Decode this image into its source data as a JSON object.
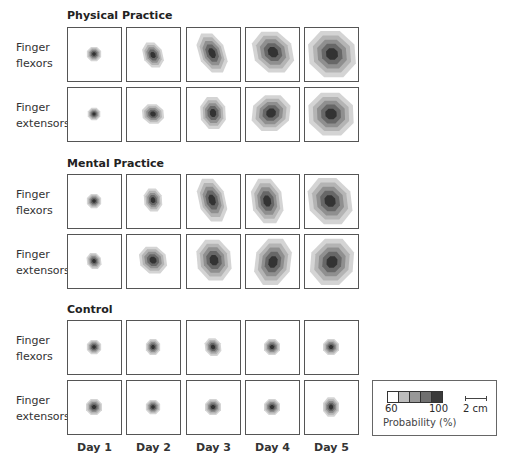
{
  "sections": [
    {
      "title": "Physical Practice",
      "title_top": 9,
      "rows_top": [
        27,
        87
      ]
    },
    {
      "title": "Mental Practice",
      "title_top": 157,
      "rows_top": [
        174,
        234
      ]
    },
    {
      "title": "Control",
      "title_top": 303,
      "rows_top": [
        320,
        380
      ]
    }
  ],
  "row_labels": {
    "flexors": [
      "Finger",
      "flexors"
    ],
    "extensors": [
      "Finger",
      "extensors"
    ]
  },
  "columns_left": [
    67,
    126,
    186,
    245,
    304
  ],
  "days": [
    "Day 1",
    "Day 2",
    "Day 3",
    "Day 4",
    "Day 5"
  ],
  "level_colors": [
    "#d4d4d4",
    "#b4b4b4",
    "#8f8f8f",
    "#676767",
    "#333333"
  ],
  "legend": {
    "swatch_colors": [
      "#ffffff",
      "#bdbdbd",
      "#989898",
      "#707070",
      "#3a3a3a"
    ],
    "min_label": "60",
    "max_label": "100",
    "title": "Probability (%)",
    "scale_label": "2 cm"
  },
  "maps": {
    "physical_flexors": [
      {
        "cx": 27,
        "cy": 27,
        "w": 16,
        "h": 16,
        "sk": 0
      },
      {
        "cx": 27,
        "cy": 28,
        "w": 22,
        "h": 28,
        "sk": 3
      },
      {
        "cx": 26,
        "cy": 26,
        "w": 30,
        "h": 44,
        "sk": 6
      },
      {
        "cx": 28,
        "cy": 25,
        "w": 44,
        "h": 46,
        "sk": 4
      },
      {
        "cx": 28,
        "cy": 27,
        "w": 52,
        "h": 52,
        "sk": 2
      }
    ],
    "physical_extensors": [
      {
        "cx": 27,
        "cy": 27,
        "w": 14,
        "h": 14,
        "sk": 0
      },
      {
        "cx": 27,
        "cy": 27,
        "w": 24,
        "h": 22,
        "sk": 1
      },
      {
        "cx": 27,
        "cy": 26,
        "w": 28,
        "h": 36,
        "sk": 1
      },
      {
        "cx": 26,
        "cy": 26,
        "w": 42,
        "h": 40,
        "sk": -2
      },
      {
        "cx": 27,
        "cy": 27,
        "w": 50,
        "h": 48,
        "sk": 1
      }
    ],
    "mental_flexors": [
      {
        "cx": 27,
        "cy": 27,
        "w": 16,
        "h": 16,
        "sk": 0
      },
      {
        "cx": 27,
        "cy": 26,
        "w": 20,
        "h": 26,
        "sk": 1
      },
      {
        "cx": 26,
        "cy": 26,
        "w": 30,
        "h": 48,
        "sk": 5
      },
      {
        "cx": 22,
        "cy": 27,
        "w": 34,
        "h": 50,
        "sk": 3
      },
      {
        "cx": 26,
        "cy": 27,
        "w": 48,
        "h": 52,
        "sk": 3
      }
    ],
    "mental_extensors": [
      {
        "cx": 27,
        "cy": 27,
        "w": 16,
        "h": 18,
        "sk": 1
      },
      {
        "cx": 27,
        "cy": 26,
        "w": 30,
        "h": 30,
        "sk": 2
      },
      {
        "cx": 28,
        "cy": 26,
        "w": 38,
        "h": 46,
        "sk": 2
      },
      {
        "cx": 28,
        "cy": 28,
        "w": 40,
        "h": 52,
        "sk": -3
      },
      {
        "cx": 28,
        "cy": 28,
        "w": 48,
        "h": 52,
        "sk": -2
      }
    ],
    "control_flexors": [
      {
        "cx": 27,
        "cy": 27,
        "w": 16,
        "h": 16,
        "sk": 0
      },
      {
        "cx": 27,
        "cy": 27,
        "w": 16,
        "h": 18,
        "sk": 0
      },
      {
        "cx": 27,
        "cy": 27,
        "w": 18,
        "h": 20,
        "sk": 1
      },
      {
        "cx": 27,
        "cy": 27,
        "w": 18,
        "h": 18,
        "sk": 0
      },
      {
        "cx": 27,
        "cy": 27,
        "w": 18,
        "h": 18,
        "sk": 0
      }
    ],
    "control_extensors": [
      {
        "cx": 27,
        "cy": 27,
        "w": 18,
        "h": 18,
        "sk": 0
      },
      {
        "cx": 27,
        "cy": 27,
        "w": 16,
        "h": 16,
        "sk": 0
      },
      {
        "cx": 27,
        "cy": 27,
        "w": 18,
        "h": 18,
        "sk": 0
      },
      {
        "cx": 27,
        "cy": 27,
        "w": 18,
        "h": 18,
        "sk": 0
      },
      {
        "cx": 27,
        "cy": 27,
        "w": 18,
        "h": 22,
        "sk": 0
      }
    ]
  }
}
